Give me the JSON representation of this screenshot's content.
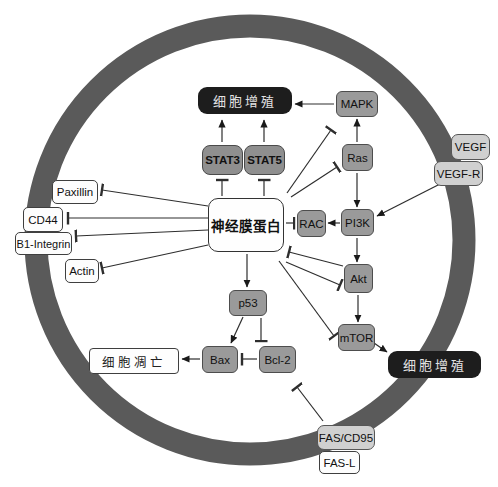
{
  "diagram": {
    "type": "cell-signaling-pathway",
    "central_protein": "神经膜蛋白",
    "colors": {
      "membrane": "#5a5a5a",
      "black_box": "#1d1d1d",
      "black_box_text": "#e3e3e3",
      "gray_box": "#9a9a9a",
      "stat_box": "#8f8f8f",
      "light_gray_box": "#d0d0d0",
      "white_box": "#fdfdfd",
      "line": "#2e2e2e"
    },
    "nodes": {
      "merlin": {
        "label": "神经膜蛋白"
      },
      "proliferation_top": {
        "label": "细胞增殖"
      },
      "proliferation_right": {
        "label": "细胞增殖"
      },
      "apoptosis": {
        "label": "细胞凋亡"
      },
      "stat3": {
        "label": "STAT3"
      },
      "stat5": {
        "label": "STAT5"
      },
      "mapk": {
        "label": "MAPK"
      },
      "ras": {
        "label": "Ras"
      },
      "rac": {
        "label": "RAC"
      },
      "pi3k": {
        "label": "PI3K"
      },
      "akt": {
        "label": "Akt"
      },
      "mtor": {
        "label": "mTOR"
      },
      "p53": {
        "label": "p53"
      },
      "bax": {
        "label": "Bax"
      },
      "bcl2": {
        "label": "Bcl-2"
      },
      "vegf": {
        "label": "VEGF"
      },
      "vegfr": {
        "label": "VEGF-R"
      },
      "fas_cd95": {
        "label": "FAS/CD95"
      },
      "fas_l": {
        "label": "FAS-L"
      },
      "paxillin": {
        "label": "Paxillin"
      },
      "cd44": {
        "label": "CD44"
      },
      "b1_integrin": {
        "label": "B1-Integrin"
      },
      "actin": {
        "label": "Actin"
      }
    },
    "edges": [
      {
        "from": "STAT3",
        "to": "细胞增殖(top)",
        "type": "activation"
      },
      {
        "from": "STAT5",
        "to": "细胞增殖(top)",
        "type": "activation"
      },
      {
        "from": "MAPK",
        "to": "细胞增殖(top)",
        "type": "activation"
      },
      {
        "from": "Ras",
        "to": "MAPK",
        "type": "activation"
      },
      {
        "from": "Ras",
        "to": "PI3K",
        "type": "activation"
      },
      {
        "from": "PI3K",
        "to": "RAC",
        "type": "activation"
      },
      {
        "from": "PI3K",
        "to": "Akt",
        "type": "activation"
      },
      {
        "from": "Akt",
        "to": "mTOR",
        "type": "activation"
      },
      {
        "from": "mTOR",
        "to": "细胞增殖(right)",
        "type": "activation"
      },
      {
        "from": "VEGF-R",
        "to": "PI3K",
        "type": "activation"
      },
      {
        "from": "神经膜蛋白",
        "to": "STAT3",
        "type": "inhibition"
      },
      {
        "from": "神经膜蛋白",
        "to": "STAT5",
        "type": "inhibition"
      },
      {
        "from": "神经膜蛋白",
        "to": "MAPK",
        "type": "inhibition"
      },
      {
        "from": "神经膜蛋白",
        "to": "Ras",
        "type": "inhibition"
      },
      {
        "from": "神经膜蛋白",
        "to": "RAC",
        "type": "inhibition"
      },
      {
        "from": "神经膜蛋白",
        "to": "Akt",
        "type": "inhibition"
      },
      {
        "from": "Akt",
        "to": "神经膜蛋白",
        "type": "inhibition"
      },
      {
        "from": "神经膜蛋白",
        "to": "mTOR",
        "type": "inhibition"
      },
      {
        "from": "神经膜蛋白",
        "to": "p53",
        "type": "activation"
      },
      {
        "from": "神经膜蛋白",
        "to": "Paxillin",
        "type": "inhibition"
      },
      {
        "from": "神经膜蛋白",
        "to": "CD44",
        "type": "inhibition"
      },
      {
        "from": "神经膜蛋白",
        "to": "B1-Integrin",
        "type": "inhibition"
      },
      {
        "from": "神经膜蛋白",
        "to": "Actin",
        "type": "inhibition"
      },
      {
        "from": "p53",
        "to": "Bax",
        "type": "activation"
      },
      {
        "from": "p53",
        "to": "Bcl-2",
        "type": "inhibition"
      },
      {
        "from": "Bcl-2",
        "to": "Bax",
        "type": "inhibition"
      },
      {
        "from": "Bax",
        "to": "细胞凋亡",
        "type": "activation"
      },
      {
        "from": "FAS/CD95",
        "to": "Bcl-2",
        "type": "inhibition"
      }
    ]
  }
}
